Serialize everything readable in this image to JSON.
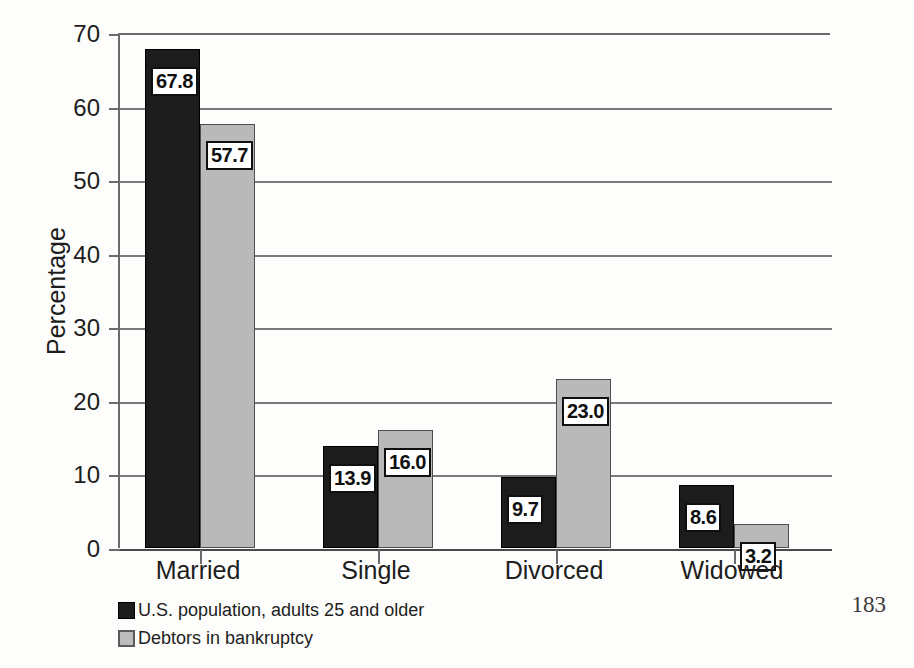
{
  "page": {
    "page_number": "183",
    "background_color": "#fdfdfc"
  },
  "chart_data": {
    "type": "bar",
    "title": "",
    "xlabel": "",
    "ylabel": "Percentage",
    "categories": [
      "Married",
      "Single",
      "Divorced",
      "Widowed"
    ],
    "series": [
      {
        "name": "U.S. population, adults 25 and older",
        "color": "#1c1c1c",
        "values": [
          67.8,
          13.9,
          9.7,
          8.6
        ],
        "labels": [
          "67.8",
          "13.9",
          "9.7",
          "8.6"
        ]
      },
      {
        "name": "Debtors in bankruptcy",
        "color": "#b9b9b9",
        "values": [
          57.7,
          16.0,
          23.0,
          3.2
        ],
        "labels": [
          "57.7",
          "16.0",
          "23.0",
          "3.2"
        ]
      }
    ],
    "ylim": [
      0,
      70
    ],
    "yticks": [
      0,
      10,
      20,
      30,
      40,
      50,
      60,
      70
    ],
    "ytick_labels": [
      "0",
      "10",
      "20",
      "30",
      "40",
      "50",
      "60",
      "70"
    ],
    "grid": true,
    "grid_axis": "y",
    "legend_position": "below-left",
    "legend": [
      "U.S. population, adults 25 and older",
      "Debtors in bankruptcy"
    ]
  }
}
